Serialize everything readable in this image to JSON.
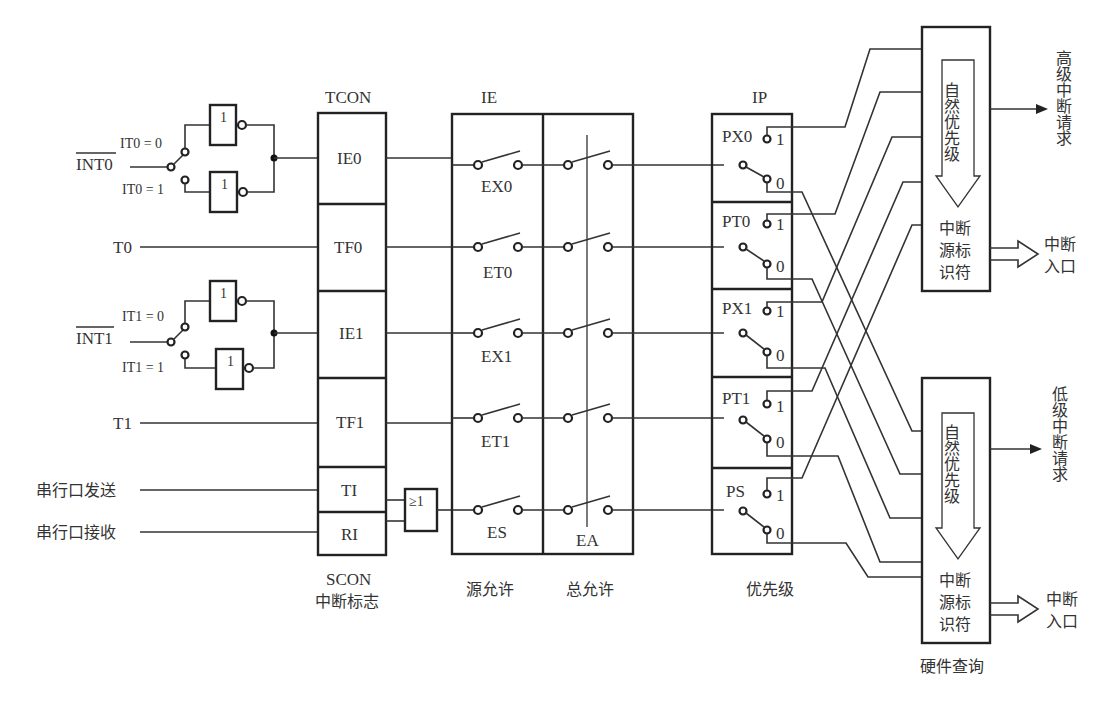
{
  "diagram": {
    "type": "8051 interrupt system block diagram",
    "inputs": {
      "int0": "INT0",
      "it0_0": "IT0 = 0",
      "it0_1": "IT0 = 1",
      "t0": "T0",
      "int1": "INT1",
      "it1_0": "IT1 = 0",
      "it1_1": "IT1 = 1",
      "t1": "T1",
      "serial_tx": "串行口发送",
      "serial_rx": "串行口接收"
    },
    "gates": {
      "not": "1",
      "or": "≥1"
    },
    "tcon": {
      "title": "TCON",
      "cells": [
        "IE0",
        "TF0",
        "IE1",
        "TF1"
      ],
      "scon_cells": [
        "TI",
        "RI"
      ],
      "bottom_label_1": "SCON",
      "bottom_label_2": "中断标志"
    },
    "ie": {
      "title": "IE",
      "source_switches": [
        "EX0",
        "ET0",
        "EX1",
        "ET1",
        "ES"
      ],
      "global_switch": "EA",
      "label_source": "源允许",
      "label_global": "总允许"
    },
    "ip": {
      "title": "IP",
      "cells": [
        "PX0",
        "PT0",
        "PX1",
        "PT1",
        "PS"
      ],
      "pos_1": "1",
      "pos_0": "0",
      "bottom_label": "优先级"
    },
    "high_block": {
      "arrow_label": "自然优先级",
      "id_label": [
        "中断",
        "源标",
        "识符"
      ],
      "output_label": "高级中断请求",
      "entry_label": [
        "中断",
        "入口"
      ]
    },
    "low_block": {
      "arrow_label": "自然优先级",
      "id_label": [
        "中断",
        "源标",
        "识符"
      ],
      "output_label": "低级中断请求",
      "entry_label": [
        "中断",
        "入口"
      ],
      "bottom_label": "硬件查询"
    }
  }
}
